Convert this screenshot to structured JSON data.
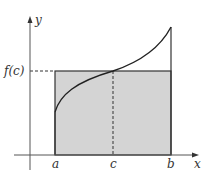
{
  "figure": {
    "labels": {
      "y_axis": "y",
      "x_axis": "x",
      "fc": "f(c)",
      "a": "a",
      "c": "c",
      "b": "b"
    },
    "colors": {
      "shade": "#d4d4d4",
      "stroke": "#333333",
      "axis": "#555555",
      "curve": "#222222"
    },
    "data": {
      "a": 1,
      "c": 2,
      "b": 3,
      "f_a": 1.1,
      "f_c": 2.1,
      "f_b": 3.3,
      "description": "Increasing concave-then-convex curve from a to b; shaded rectangle of height f(c) spans [a, b], equal in area to region under curve."
    }
  }
}
